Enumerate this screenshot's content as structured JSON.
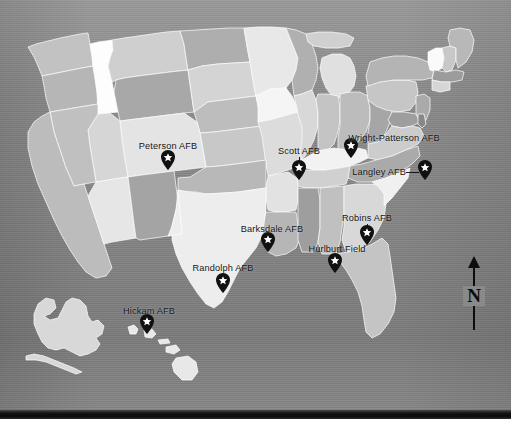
{
  "map": {
    "title": "United States Air Force Base Locations Map",
    "background_color": "#8a8a8a",
    "state_fill_colors": [
      "#fdfdfd",
      "#f0f0f0",
      "#e2e2e2",
      "#d2d2d2",
      "#c2c2c2",
      "#b2b2b2",
      "#a3a3a3"
    ],
    "state_border_color": "#ffffff",
    "marker_color": "#111111",
    "marker_star_color": "#ffffff",
    "label_color": "#161616"
  },
  "markers": [
    {
      "id": "peterson",
      "label": "Peterson AFB",
      "pin_x": 168,
      "pin_y": 170,
      "label_x": 168,
      "label_y": 146,
      "anchor": "center",
      "leader": "vertical"
    },
    {
      "id": "scott",
      "label": "Scott AFB",
      "pin_x": 299,
      "pin_y": 180,
      "label_x": 299,
      "label_y": 151,
      "anchor": "center",
      "leader": "vertical"
    },
    {
      "id": "wright-patterson",
      "label": "Wright-Patterson AFB",
      "pin_x": 351,
      "pin_y": 158,
      "label_x": 394,
      "label_y": 138,
      "anchor": "center",
      "leader": "vertical"
    },
    {
      "id": "langley",
      "label": "Langley AFB",
      "pin_x": 425,
      "pin_y": 178,
      "label_x": 404,
      "label_y": 172,
      "anchor": "right",
      "leader": "horizontal"
    },
    {
      "id": "barksdale",
      "label": "Barksdale AFB",
      "pin_x": 268,
      "pin_y": 252,
      "label_x": 272,
      "label_y": 229,
      "anchor": "center",
      "leader": "vertical"
    },
    {
      "id": "robins",
      "label": "Robins AFB",
      "pin_x": 367,
      "pin_y": 245,
      "label_x": 367,
      "label_y": 218,
      "anchor": "center",
      "leader": "vertical"
    },
    {
      "id": "hurlburt",
      "label": "Hurlburt Field",
      "pin_x": 335,
      "pin_y": 273,
      "label_x": 337,
      "label_y": 249,
      "anchor": "center",
      "leader": "vertical"
    },
    {
      "id": "randolph",
      "label": "Randolph AFB",
      "pin_x": 223,
      "pin_y": 293,
      "label_x": 223,
      "label_y": 268,
      "anchor": "center",
      "leader": "vertical"
    },
    {
      "id": "hickam",
      "label": "Hickam AFB",
      "pin_x": 147,
      "pin_y": 334,
      "label_x": 149,
      "label_y": 311,
      "anchor": "center",
      "leader": "vertical"
    }
  ],
  "compass": {
    "label": "N",
    "direction": "north"
  }
}
